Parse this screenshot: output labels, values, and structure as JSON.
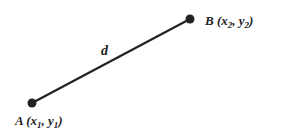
{
  "diagram": {
    "line_label": "d",
    "points": [
      {
        "name": "A",
        "coords_label": "(x",
        "sub1": "1",
        "mid": ", y",
        "sub2": "1",
        "close": ")"
      },
      {
        "name": "B",
        "coords_label": "(x",
        "sub1": "2",
        "mid": ", y",
        "sub2": "2",
        "close": ")"
      }
    ],
    "colors": {
      "stroke": "#222222",
      "background": "#ffffff"
    }
  }
}
